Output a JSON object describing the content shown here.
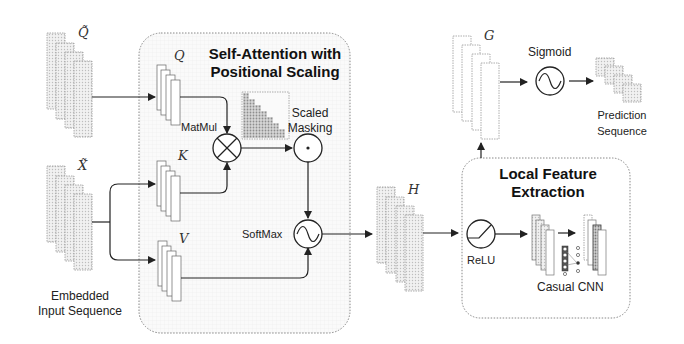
{
  "diagram": {
    "left": {
      "q_tilde_symbol": "Q̃",
      "x_tilde_symbol": "X̃",
      "caption_line1": "Embedded",
      "caption_line2": "Input Sequence"
    },
    "attention_block": {
      "title_line1": "Self-Attention with",
      "title_line2": "Positional Scaling",
      "q_symbol": "Q",
      "k_symbol": "K",
      "v_symbol": "V",
      "matmul_label": "MatMul",
      "masking_label_line1": "Scaled",
      "masking_label_line2": "Masking",
      "softmax_label": "SoftMax"
    },
    "h_symbol": "H",
    "local_block": {
      "title_line1": "Local Feature",
      "title_line2": "Extraction",
      "relu_label": "ReLU",
      "cnn_label": "Casual CNN"
    },
    "output": {
      "g_symbol": "G",
      "sigmoid_label": "Sigmoid",
      "caption_line1": "Prediction",
      "caption_line2": "Sequence"
    },
    "colors": {
      "stroke": "#222222",
      "fill_light": "#e4e4e4",
      "fill_dark": "#555555",
      "box_border": "#888888",
      "box_fill": "#f7f7f7"
    }
  }
}
